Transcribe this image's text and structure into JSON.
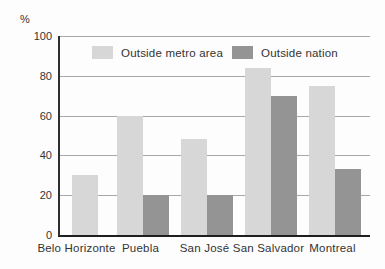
{
  "chart_data": {
    "type": "bar",
    "title": "",
    "xlabel": "",
    "ylabel": "%",
    "categories": [
      "Belo Horizonte",
      "Puebla",
      "San José",
      "San Salvador",
      "Montreal"
    ],
    "series": [
      {
        "name": "Outside metro area",
        "color": "#d7d7d7",
        "values": [
          30,
          60,
          48,
          84,
          75
        ]
      },
      {
        "name": "Outside nation",
        "color": "#949494",
        "values": [
          null,
          20,
          20,
          70,
          33
        ]
      }
    ],
    "ylim": [
      0,
      100
    ],
    "yticks": [
      0,
      20,
      40,
      60,
      80,
      100
    ],
    "grid": true,
    "legend_position": "top-inside"
  },
  "colors": {
    "background": "#fdfdfd",
    "axis": "#2e2e2e",
    "gridline": "#a8a8a8",
    "text": "#333333"
  }
}
